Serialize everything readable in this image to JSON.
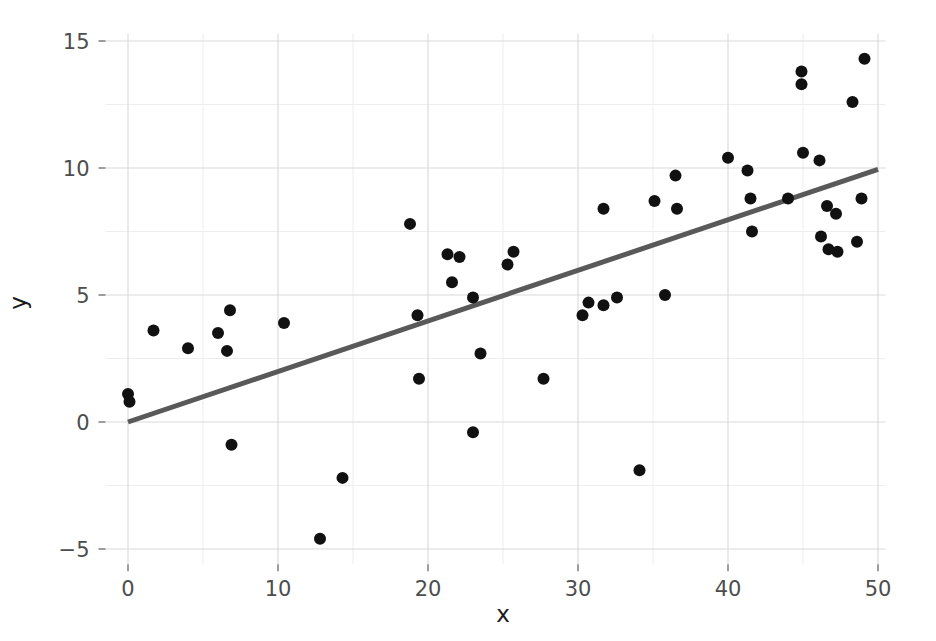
{
  "chart_data": {
    "type": "scatter",
    "title": "",
    "xlabel": "x",
    "ylabel": "y",
    "xlim": [
      -1.5,
      50.5
    ],
    "ylim": [
      -5.6,
      15.3
    ],
    "xticks": [
      0,
      10,
      20,
      30,
      40,
      50
    ],
    "yticks": [
      -5,
      0,
      5,
      10,
      15
    ],
    "xtick_labels": [
      "0",
      "10",
      "20",
      "30",
      "40",
      "50"
    ],
    "ytick_labels": [
      "−5",
      "0",
      "5",
      "10",
      "15"
    ],
    "x_minor_ticks": [
      5,
      15,
      25,
      35,
      45
    ],
    "y_minor_ticks": [
      -2.5,
      2.5,
      7.5,
      12.5
    ],
    "grid": true,
    "legend": "none",
    "background_color": "#ffffff",
    "point_color": "#111111",
    "point_radius": 6,
    "grid_color": "#d9d9d9",
    "minor_grid_color": "#ededed",
    "series": [
      {
        "name": "observations",
        "marker": "circle",
        "points": [
          [
            0.0,
            1.1
          ],
          [
            0.1,
            0.8
          ],
          [
            1.7,
            3.6
          ],
          [
            4.0,
            2.9
          ],
          [
            6.0,
            3.5
          ],
          [
            6.6,
            2.8
          ],
          [
            6.8,
            4.4
          ],
          [
            6.9,
            -0.9
          ],
          [
            10.4,
            3.9
          ],
          [
            12.8,
            -4.6
          ],
          [
            14.3,
            -2.2
          ],
          [
            18.8,
            7.8
          ],
          [
            19.3,
            4.2
          ],
          [
            19.4,
            1.7
          ],
          [
            21.3,
            6.6
          ],
          [
            22.1,
            6.5
          ],
          [
            21.6,
            5.5
          ],
          [
            23.0,
            4.9
          ],
          [
            23.0,
            -0.4
          ],
          [
            23.5,
            2.7
          ],
          [
            25.3,
            6.2
          ],
          [
            25.7,
            6.7
          ],
          [
            27.7,
            1.7
          ],
          [
            30.3,
            4.2
          ],
          [
            30.7,
            4.7
          ],
          [
            31.7,
            4.6
          ],
          [
            31.7,
            8.4
          ],
          [
            32.6,
            4.9
          ],
          [
            34.1,
            -1.9
          ],
          [
            35.1,
            8.7
          ],
          [
            35.8,
            5.0
          ],
          [
            36.5,
            9.7
          ],
          [
            36.6,
            8.4
          ],
          [
            40.0,
            10.4
          ],
          [
            41.3,
            9.9
          ],
          [
            41.5,
            8.8
          ],
          [
            41.6,
            7.5
          ],
          [
            44.0,
            8.8
          ],
          [
            44.9,
            13.8
          ],
          [
            44.9,
            13.3
          ],
          [
            45.0,
            10.6
          ],
          [
            46.1,
            10.3
          ],
          [
            46.2,
            7.3
          ],
          [
            46.6,
            8.5
          ],
          [
            46.7,
            6.8
          ],
          [
            47.2,
            8.2
          ],
          [
            47.3,
            6.7
          ],
          [
            48.3,
            12.6
          ],
          [
            48.6,
            7.1
          ],
          [
            48.9,
            8.8
          ],
          [
            49.1,
            14.3
          ]
        ]
      }
    ],
    "fit_line": {
      "name": "linear-fit",
      "color": "#595959",
      "x_start": 0.0,
      "y_start": 0.0,
      "x_end": 50.0,
      "y_end": 9.95,
      "slope": 0.199,
      "intercept": 0.0
    }
  }
}
